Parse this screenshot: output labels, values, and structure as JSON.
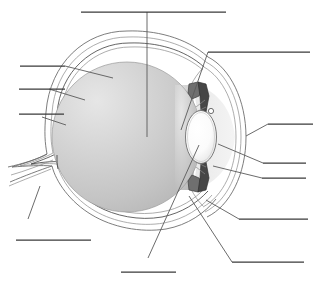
{
  "figure": {
    "width": 321,
    "height": 285,
    "background_color": "#ffffff",
    "label_text_present": false,
    "note": "All label rules are blank — no text is printed on the diagram"
  },
  "palette": {
    "page_background": "#ffffff",
    "outline_stroke": "#6e6e6e",
    "dark_stroke": "#3d3d3d",
    "leader_stroke": "#5a5a5a",
    "label_rule_stroke": "#3a3a3a",
    "vitreous_light": "#e2e2e2",
    "vitreous_mid": "#c9c9c9",
    "vitreous_dark": "#b4b4b4",
    "sclera_fill": "#ffffff",
    "anterior_chamber_fill": "#ededed",
    "lens_light": "#ffffff",
    "lens_shadow": "#d8d8d8",
    "iris_fill": "#4a4a4a",
    "ciliary_fill": "#6a6a6a"
  },
  "structures": [
    {
      "id": "sclera",
      "name": "sclera",
      "region": "outer white coat of the globe"
    },
    {
      "id": "choroid",
      "name": "choroid",
      "region": "middle vascular layer"
    },
    {
      "id": "retina",
      "name": "retina",
      "region": "inner sensory layer"
    },
    {
      "id": "vitreous-body",
      "name": "vitreous body",
      "region": "large gray interior chamber"
    },
    {
      "id": "lens",
      "name": "lens",
      "region": "white biconvex ellipse, anterior"
    },
    {
      "id": "cornea",
      "name": "cornea",
      "region": "clear anterior bulge, right side"
    },
    {
      "id": "anterior-chamber",
      "name": "anterior chamber",
      "region": "space between cornea and lens"
    },
    {
      "id": "iris-superior",
      "name": "iris (superior)",
      "region": "dark wedge above the lens"
    },
    {
      "id": "iris-inferior",
      "name": "iris (inferior)",
      "region": "dark wedge below the lens"
    },
    {
      "id": "ciliary-body-sup",
      "name": "ciliary body (superior)",
      "region": "attachment above lens"
    },
    {
      "id": "ciliary-body-inf",
      "name": "ciliary body (inferior)",
      "region": "attachment below lens"
    },
    {
      "id": "optic-nerve",
      "name": "optic nerve",
      "region": "posterior stalk, left side"
    },
    {
      "id": "optic-disc",
      "name": "optic disc",
      "region": "nerve head at posterior pole"
    },
    {
      "id": "fovea",
      "name": "fovea / macula",
      "region": "posterior inner wall"
    },
    {
      "id": "suspensory-ligament",
      "name": "suspensory ligament",
      "region": "zonule fibers at lens equator"
    }
  ],
  "callouts": [
    {
      "id": "callout-top",
      "position": "top-center",
      "rule": {
        "x1": 81,
        "y1": 12,
        "x2": 226,
        "y2": 12
      },
      "leader": {
        "x1": 147,
        "y1": 12,
        "x2": 147,
        "y2": 137
      },
      "points_to": "vitreous-body",
      "label": ""
    },
    {
      "id": "callout-upper-right",
      "position": "upper-right",
      "rule": {
        "x1": 208,
        "y1": 52,
        "x2": 310,
        "y2": 52
      },
      "leader": {
        "x1": 208,
        "y1": 52,
        "x2": 181,
        "y2": 130
      },
      "points_to": "cornea",
      "label": ""
    },
    {
      "id": "callout-left-1",
      "position": "left-upper",
      "rule": {
        "x1": 20,
        "y1": 66,
        "x2": 65,
        "y2": 66
      },
      "leader": {
        "x1": 65,
        "y1": 66,
        "x2": 113,
        "y2": 78
      },
      "points_to": "sclera",
      "label": ""
    },
    {
      "id": "callout-left-2",
      "position": "left-middle",
      "rule": {
        "x1": 19,
        "y1": 89,
        "x2": 65,
        "y2": 89
      },
      "leader": {
        "x1": 49,
        "y1": 89,
        "x2": 85,
        "y2": 100
      },
      "points_to": "choroid",
      "label": ""
    },
    {
      "id": "callout-left-3",
      "position": "left-lower",
      "rule": {
        "x1": 19,
        "y1": 114,
        "x2": 64,
        "y2": 114
      },
      "leader": {
        "x1": 42,
        "y1": 117,
        "x2": 66,
        "y2": 125
      },
      "points_to": "retina",
      "label": ""
    },
    {
      "id": "callout-right-1",
      "position": "right-upper",
      "rule": {
        "x1": 268,
        "y1": 124,
        "x2": 313,
        "y2": 124
      },
      "leader": {
        "x1": 268,
        "y1": 124,
        "x2": 246,
        "y2": 136
      },
      "points_to": "anterior-chamber",
      "label": ""
    },
    {
      "id": "callout-right-2",
      "position": "right-middle",
      "rule": {
        "x1": 263,
        "y1": 163,
        "x2": 306,
        "y2": 163
      },
      "leader": {
        "x1": 263,
        "y1": 163,
        "x2": 218,
        "y2": 144
      },
      "points_to": "lens",
      "label": ""
    },
    {
      "id": "callout-right-3",
      "position": "right-lower",
      "rule": {
        "x1": 262,
        "y1": 178,
        "x2": 306,
        "y2": 178
      },
      "leader": {
        "x1": 262,
        "y1": 178,
        "x2": 213,
        "y2": 166
      },
      "points_to": "iris-inferior",
      "label": ""
    },
    {
      "id": "callout-right-4",
      "position": "right-lower-outer",
      "rule": {
        "x1": 239,
        "y1": 219,
        "x2": 308,
        "y2": 219
      },
      "leader": {
        "x1": 239,
        "y1": 219,
        "x2": 206,
        "y2": 200
      },
      "points_to": "ciliary-body-inf",
      "label": ""
    },
    {
      "id": "callout-bottom-right",
      "position": "bottom-right",
      "rule": {
        "x1": 232,
        "y1": 262,
        "x2": 304,
        "y2": 262
      },
      "leader": {
        "x1": 232,
        "y1": 262,
        "x2": 189,
        "y2": 196
      },
      "points_to": "sclera",
      "label": ""
    },
    {
      "id": "callout-bottom-left",
      "position": "bottom-left",
      "rule": {
        "x1": 16,
        "y1": 240,
        "x2": 91,
        "y2": 240
      },
      "leader": {
        "x1": 28,
        "y1": 219,
        "x2": 40,
        "y2": 186
      },
      "points_to": "optic-nerve",
      "label": ""
    },
    {
      "id": "callout-bottom-mid",
      "position": "bottom-center",
      "rule": {
        "x1": 121,
        "y1": 272,
        "x2": 176,
        "y2": 272
      },
      "leader": {
        "x1": 148,
        "y1": 258,
        "x2": 199,
        "y2": 145
      },
      "points_to": "lens",
      "label": ""
    }
  ],
  "geometry": {
    "globe_center": {
      "cx": 127,
      "cy": 137
    },
    "globe_radius": 75,
    "lens": {
      "cx": 201,
      "cy": 137,
      "rx": 15,
      "ry": 26
    },
    "cornea_apex_x": 247,
    "optic_nerve_exit": {
      "x": 58,
      "y": 172
    }
  }
}
